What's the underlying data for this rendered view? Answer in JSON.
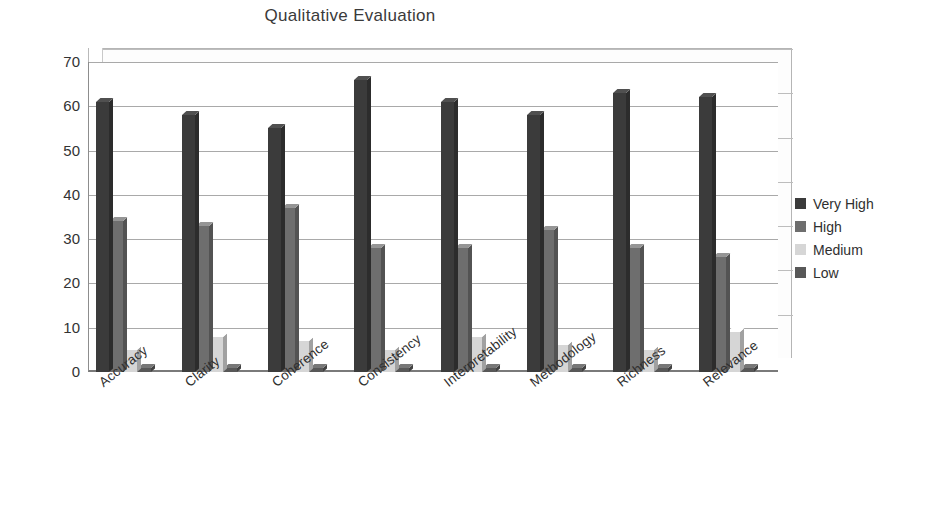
{
  "chart_data": {
    "type": "bar",
    "title": "Qualitative Evaluation",
    "xlabel": "",
    "ylabel": "",
    "ylim": [
      0,
      70
    ],
    "yticks": [
      0,
      10,
      20,
      30,
      40,
      50,
      60,
      70
    ],
    "grid": true,
    "legend_position": "right",
    "style": "3d-clustered-column",
    "categories": [
      "Accuracy",
      "Clarity",
      "Coherence",
      "Consistency",
      "Interpretability",
      "Methodology",
      "Richness",
      "Relevance"
    ],
    "series": [
      {
        "name": "Very High",
        "color": "#3b3b3b",
        "values": [
          61,
          58,
          55,
          66,
          61,
          58,
          63,
          62
        ]
      },
      {
        "name": "High",
        "color": "#6e6e6e",
        "values": [
          34,
          33,
          37,
          28,
          28,
          32,
          28,
          26
        ]
      },
      {
        "name": "Medium",
        "color": "#d6d6d6",
        "values": [
          5,
          8,
          7,
          5,
          8,
          6,
          5,
          9
        ]
      },
      {
        "name": "Low",
        "color": "#585858",
        "values": [
          1,
          1,
          1,
          1,
          1,
          1,
          1,
          1
        ]
      }
    ]
  },
  "legend": {
    "items": [
      {
        "label": "Very High",
        "color": "#3b3b3b"
      },
      {
        "label": "High",
        "color": "#6e6e6e"
      },
      {
        "label": "Medium",
        "color": "#d6d6d6"
      },
      {
        "label": "Low",
        "color": "#585858"
      }
    ]
  }
}
